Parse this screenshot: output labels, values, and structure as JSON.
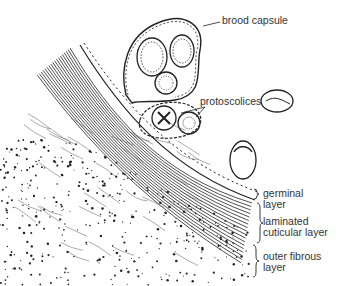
{
  "figure": {
    "labels": {
      "brood_capsule": "brood capsule",
      "protoscolices": "protoscolices",
      "germinal_layer": [
        "germinal",
        "layer"
      ],
      "laminated_layer": [
        "laminated",
        "cuticular layer"
      ],
      "outer_fibrous_layer": [
        "outer fibrous",
        "layer"
      ]
    },
    "colors": {
      "ink": "#222222",
      "label": "#333333",
      "background": "#ffffff"
    }
  }
}
